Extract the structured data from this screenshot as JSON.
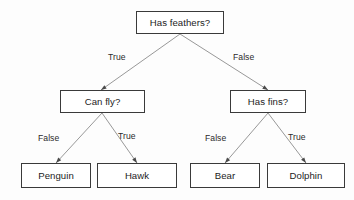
{
  "diagram": {
    "type": "decision-tree",
    "title": "Has feathers?",
    "style": {
      "background_color": "#fdfdfd",
      "box_border_color": "#3a3a3a",
      "box_fill_color": "#ffffff",
      "text_color": "#1c1c1c",
      "edge_color": "#8c8c8c"
    },
    "nodes": [
      {
        "id": "root",
        "label": "Has feathers?",
        "kind": "decision",
        "x": 136,
        "y": 11,
        "w": 88,
        "h": 23
      },
      {
        "id": "can-fly",
        "label": "Can fly?",
        "kind": "decision",
        "x": 60,
        "y": 90,
        "w": 85,
        "h": 23
      },
      {
        "id": "has-fins",
        "label": "Has fins?",
        "kind": "decision",
        "x": 230,
        "y": 90,
        "w": 76,
        "h": 23
      },
      {
        "id": "penguin",
        "label": "Penguin",
        "kind": "leaf",
        "x": 21,
        "y": 163,
        "w": 70,
        "h": 25
      },
      {
        "id": "hawk",
        "label": "Hawk",
        "kind": "leaf",
        "x": 97,
        "y": 163,
        "w": 80,
        "h": 25
      },
      {
        "id": "bear",
        "label": "Bear",
        "kind": "leaf",
        "x": 190,
        "y": 163,
        "w": 70,
        "h": 25
      },
      {
        "id": "dolphin",
        "label": "Dolphin",
        "kind": "leaf",
        "x": 267,
        "y": 163,
        "w": 78,
        "h": 25
      }
    ],
    "edges": [
      {
        "id": "root-true",
        "from": "root",
        "to": "can-fly",
        "label": "True",
        "x1": 180,
        "y1": 34,
        "x2": 101,
        "y2": 90,
        "label_x": 108,
        "label_y": 53
      },
      {
        "id": "root-false",
        "from": "root",
        "to": "has-fins",
        "label": "False",
        "x1": 180,
        "y1": 34,
        "x2": 268,
        "y2": 90,
        "label_x": 233,
        "label_y": 53
      },
      {
        "id": "canfly-false",
        "from": "can-fly",
        "to": "penguin",
        "label": "False",
        "x1": 102,
        "y1": 113,
        "x2": 56,
        "y2": 163,
        "label_x": 38,
        "label_y": 134
      },
      {
        "id": "canfly-true",
        "from": "can-fly",
        "to": "hawk",
        "label": "True",
        "x1": 102,
        "y1": 113,
        "x2": 137,
        "y2": 163,
        "label_x": 118,
        "label_y": 132
      },
      {
        "id": "hasfins-false",
        "from": "has-fins",
        "to": "bear",
        "label": "False",
        "x1": 268,
        "y1": 113,
        "x2": 225,
        "y2": 163,
        "label_x": 205,
        "label_y": 134
      },
      {
        "id": "hasfins-true",
        "from": "has-fins",
        "to": "dolphin",
        "label": "True",
        "x1": 268,
        "y1": 113,
        "x2": 306,
        "y2": 163,
        "label_x": 288,
        "label_y": 133
      }
    ]
  }
}
